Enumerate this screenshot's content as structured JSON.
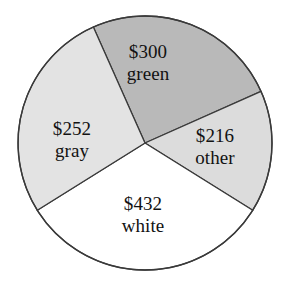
{
  "chart_data": {
    "type": "pie",
    "title": "",
    "subtitle": "",
    "xlabel": "",
    "ylabel": "",
    "legend_position": "none",
    "grid": false,
    "total": 1200,
    "units": "USD",
    "categories": [
      "green",
      "other",
      "white",
      "gray"
    ],
    "values": [
      300,
      216,
      432,
      252
    ],
    "value_labels": [
      "$300",
      "$216",
      "$432",
      "$252"
    ],
    "percentages": [
      25.0,
      18.0,
      36.0,
      21.0
    ],
    "slice_angles_deg": [
      90.0,
      64.8,
      129.6,
      75.6
    ],
    "colors": [
      "#b9b9b9",
      "#dcdcdc",
      "#ffffff",
      "#e3e3e3"
    ],
    "outline_color": "#3a3a3a",
    "slices": [
      {
        "name": "green",
        "value": 300,
        "value_label": "$300",
        "name_label": "green",
        "percent": 25.0,
        "fill": "#b9b9b9",
        "start_angle_deg": 24,
        "end_angle_deg": 114,
        "label_x": 148,
        "label_y": 63
      },
      {
        "name": "other",
        "value": 216,
        "value_label": "$216",
        "name_label": "other",
        "percent": 18.0,
        "fill": "#dcdcdc",
        "start_angle_deg": -32,
        "end_angle_deg": 24,
        "label_x": 215,
        "label_y": 147
      },
      {
        "name": "white",
        "value": 432,
        "value_label": "$432",
        "name_label": "white",
        "percent": 36.0,
        "fill": "#ffffff",
        "start_angle_deg": -148,
        "end_angle_deg": -32,
        "label_x": 143,
        "label_y": 215
      },
      {
        "name": "gray",
        "value": 252,
        "value_label": "$252",
        "name_label": "gray",
        "percent": 21.0,
        "fill": "#e3e3e3",
        "start_angle_deg": 114,
        "end_angle_deg": 212,
        "label_x": 72,
        "label_y": 140
      }
    ],
    "geometry": {
      "center_x": 145,
      "center_y": 143,
      "radius": 127
    },
    "background": "#ffffff"
  }
}
